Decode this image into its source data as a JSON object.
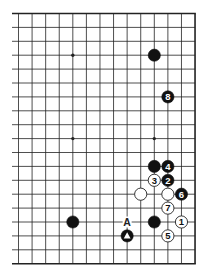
{
  "diagram": {
    "type": "go-board-diagram",
    "board_size": 19,
    "visible_columns": {
      "from": 6,
      "to": 19
    },
    "visible_rows": {
      "from": 1,
      "to": 19
    },
    "open_edges": [
      "left"
    ],
    "colors": {
      "background": "#ffffff",
      "line": "#222222",
      "black_stone": "#111111",
      "white_stone": "#ffffff",
      "white_stone_outline": "#222222",
      "black_number": "#ffffff",
      "white_number": "#111111"
    },
    "star_points": [
      {
        "col": 10,
        "row": 4
      },
      {
        "col": 16,
        "row": 4
      },
      {
        "col": 10,
        "row": 10
      },
      {
        "col": 16,
        "row": 10
      },
      {
        "col": 10,
        "row": 16
      },
      {
        "col": 16,
        "row": 16
      }
    ],
    "stones": [
      {
        "color": "black",
        "col": 16,
        "row": 4,
        "label": ""
      },
      {
        "color": "black",
        "col": 10,
        "row": 16,
        "label": ""
      },
      {
        "color": "black",
        "col": 16,
        "row": 12,
        "label": ""
      },
      {
        "color": "black",
        "col": 16,
        "row": 16,
        "label": ""
      },
      {
        "color": "white",
        "col": 15,
        "row": 14,
        "label": ""
      },
      {
        "color": "white",
        "col": 17,
        "row": 14,
        "label": ""
      },
      {
        "color": "black",
        "col": 14,
        "row": 17,
        "label": "",
        "marker": "triangle"
      },
      {
        "color": "white",
        "col": 18,
        "row": 16,
        "label": "1"
      },
      {
        "color": "black",
        "col": 17,
        "row": 13,
        "label": "2"
      },
      {
        "color": "white",
        "col": 16,
        "row": 13,
        "label": "3"
      },
      {
        "color": "black",
        "col": 17,
        "row": 12,
        "label": "4"
      },
      {
        "color": "white",
        "col": 17,
        "row": 17,
        "label": "5"
      },
      {
        "color": "black",
        "col": 18,
        "row": 14,
        "label": "6"
      },
      {
        "color": "white",
        "col": 17,
        "row": 15,
        "label": "7"
      },
      {
        "color": "black",
        "col": 17,
        "row": 7,
        "label": "8"
      }
    ],
    "point_labels": [
      {
        "col": 14,
        "row": 16,
        "text": "A"
      }
    ]
  }
}
